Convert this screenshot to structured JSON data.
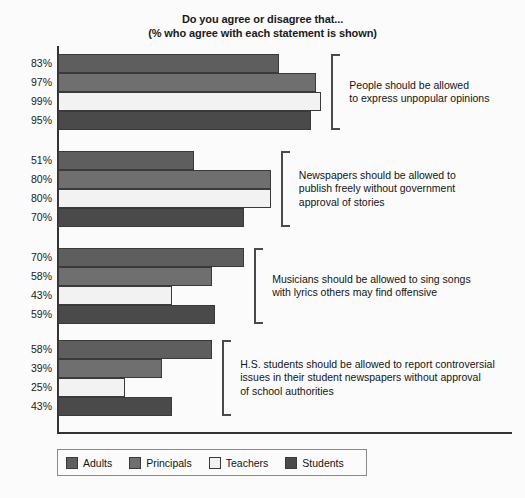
{
  "chart_data": {
    "type": "bar",
    "orientation": "horizontal",
    "title": "Do you agree or disagree that...",
    "subtitle": "(% who agree with each statement is shown)",
    "xlabel": "",
    "ylabel": "",
    "xlim": [
      0,
      100
    ],
    "grid": false,
    "legend_position": "bottom-left",
    "value_suffix": "%",
    "categories": [
      "People should be allowed to express unpopular opinions",
      "Newspapers should be allowed to publish freely without government approval of stories",
      "Musicians should be allowed to sing songs with lyrics others may find offensive",
      "H.S. students should be allowed to report controversial issues in their student newspapers without approval of school authorities"
    ],
    "series": [
      {
        "name": "Adults",
        "color": "#5e5e5e",
        "values": [
          83,
          51,
          70,
          58
        ]
      },
      {
        "name": "Principals",
        "color": "#6f6f6f",
        "values": [
          97,
          80,
          58,
          39
        ]
      },
      {
        "name": "Teachers",
        "color": "#f2f2f2",
        "values": [
          99,
          80,
          43,
          25
        ]
      },
      {
        "name": "Students",
        "color": "#4a4a4a",
        "values": [
          95,
          70,
          59,
          43
        ]
      }
    ]
  },
  "title": {
    "line1": "Do you agree or disagree that...",
    "line2": "(% who agree with each statement is shown)"
  },
  "groups": [
    {
      "statement_lines": [
        "People should be allowed",
        "to express unpopular opinions"
      ],
      "bars": [
        {
          "series": "Adults",
          "label": "83%",
          "value": 83
        },
        {
          "series": "Principals",
          "label": "97%",
          "value": 97
        },
        {
          "series": "Teachers",
          "label": "99%",
          "value": 99
        },
        {
          "series": "Students",
          "label": "95%",
          "value": 95
        }
      ]
    },
    {
      "statement_lines": [
        "Newspapers should be allowed to",
        "publish freely without government",
        "approval of stories"
      ],
      "bars": [
        {
          "series": "Adults",
          "label": "51%",
          "value": 51
        },
        {
          "series": "Principals",
          "label": "80%",
          "value": 80
        },
        {
          "series": "Teachers",
          "label": "80%",
          "value": 80
        },
        {
          "series": "Students",
          "label": "70%",
          "value": 70
        }
      ]
    },
    {
      "statement_lines": [
        "Musicians should be allowed to sing songs",
        "with lyrics others may find offensive"
      ],
      "bars": [
        {
          "series": "Adults",
          "label": "70%",
          "value": 70
        },
        {
          "series": "Principals",
          "label": "58%",
          "value": 58
        },
        {
          "series": "Teachers",
          "label": "43%",
          "value": 43
        },
        {
          "series": "Students",
          "label": "59%",
          "value": 59
        }
      ]
    },
    {
      "statement_lines": [
        "H.S. students should be allowed to report controversial",
        "issues in their student newspapers without approval",
        "of school authorities"
      ],
      "bars": [
        {
          "series": "Adults",
          "label": "58%",
          "value": 58
        },
        {
          "series": "Principals",
          "label": "39%",
          "value": 39
        },
        {
          "series": "Teachers",
          "label": "25%",
          "value": 25
        },
        {
          "series": "Students",
          "label": "43%",
          "value": 43
        }
      ]
    }
  ],
  "legend": {
    "items": [
      {
        "label": "Adults",
        "color": "#5e5e5e"
      },
      {
        "label": "Principals",
        "color": "#6f6f6f"
      },
      {
        "label": "Teachers",
        "color": "#f2f2f2"
      },
      {
        "label": "Students",
        "color": "#4a4a4a"
      }
    ]
  }
}
